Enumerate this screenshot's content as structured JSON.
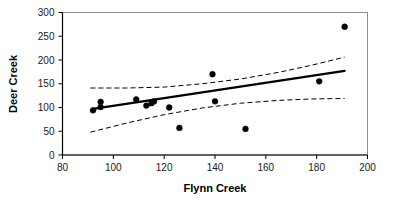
{
  "chart_data": {
    "type": "scatter",
    "title": "",
    "xlabel": "Flynn Creek",
    "ylabel": "Deer Creek",
    "xlim": [
      80,
      200
    ],
    "ylim": [
      0,
      300
    ],
    "xticks": [
      80,
      100,
      120,
      140,
      160,
      180,
      200
    ],
    "yticks": [
      0,
      50,
      100,
      150,
      200,
      250,
      300
    ],
    "xtick_labels": [
      "80",
      "100",
      "120",
      "140",
      "160",
      "180",
      "200"
    ],
    "ytick_labels": [
      "0",
      "50",
      "100",
      "150",
      "200",
      "250",
      "300"
    ],
    "grid": false,
    "legend": "none",
    "marker": "filled-circle",
    "marker_color": "#000000",
    "frame_color": "#808080",
    "points": [
      {
        "x": 92,
        "y": 94
      },
      {
        "x": 95,
        "y": 112
      },
      {
        "x": 95,
        "y": 101
      },
      {
        "x": 109,
        "y": 117
      },
      {
        "x": 113,
        "y": 104
      },
      {
        "x": 115,
        "y": 109
      },
      {
        "x": 116,
        "y": 113
      },
      {
        "x": 122,
        "y": 100
      },
      {
        "x": 126,
        "y": 57
      },
      {
        "x": 139,
        "y": 170
      },
      {
        "x": 140,
        "y": 113
      },
      {
        "x": 152,
        "y": 55
      },
      {
        "x": 181,
        "y": 155
      },
      {
        "x": 191,
        "y": 270
      }
    ],
    "regression_line": {
      "style": "solid",
      "color": "#000000",
      "points": [
        {
          "x": 92,
          "y": 97
        },
        {
          "x": 191,
          "y": 177
        }
      ]
    },
    "confidence_bands": [
      {
        "name": "upper-confidence-band",
        "style": "dashed",
        "color": "#000000",
        "points": [
          {
            "x": 91,
            "y": 141
          },
          {
            "x": 105,
            "y": 141
          },
          {
            "x": 120,
            "y": 143
          },
          {
            "x": 135,
            "y": 150
          },
          {
            "x": 150,
            "y": 160
          },
          {
            "x": 165,
            "y": 174
          },
          {
            "x": 178,
            "y": 189
          },
          {
            "x": 191,
            "y": 206
          }
        ]
      },
      {
        "name": "lower-confidence-band",
        "style": "dashed",
        "color": "#000000",
        "points": [
          {
            "x": 91,
            "y": 48
          },
          {
            "x": 105,
            "y": 67
          },
          {
            "x": 120,
            "y": 85
          },
          {
            "x": 135,
            "y": 99
          },
          {
            "x": 150,
            "y": 109
          },
          {
            "x": 165,
            "y": 115
          },
          {
            "x": 178,
            "y": 118
          },
          {
            "x": 191,
            "y": 119
          }
        ]
      }
    ]
  }
}
